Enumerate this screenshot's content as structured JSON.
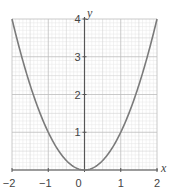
{
  "chart_data": {
    "type": "line",
    "title": "",
    "function": "y = x^2",
    "xlabel": "x",
    "ylabel": "y",
    "xlim": [
      -2,
      2
    ],
    "ylim": [
      0,
      4
    ],
    "x_ticks": [
      -2,
      -1,
      0,
      1,
      2
    ],
    "x_tick_labels": [
      "−2",
      "−1",
      "0",
      "1",
      "2"
    ],
    "y_ticks": [
      1,
      2,
      3,
      4
    ],
    "y_tick_labels": [
      "1",
      "2",
      "3",
      "4"
    ],
    "grid": {
      "major": 1,
      "medium": 0.5,
      "minor": 0.1
    },
    "series": [
      {
        "name": "y = x²",
        "x": [
          -2,
          -1.75,
          -1.5,
          -1.25,
          -1,
          -0.75,
          -0.5,
          -0.25,
          0,
          0.25,
          0.5,
          0.75,
          1,
          1.25,
          1.5,
          1.75,
          2
        ],
        "y": [
          4,
          3.0625,
          2.25,
          1.5625,
          1,
          0.5625,
          0.25,
          0.0625,
          0,
          0.0625,
          0.25,
          0.5625,
          1,
          1.5625,
          2.25,
          3.0625,
          4
        ]
      }
    ],
    "colors": {
      "curve": "#7a7a7a",
      "axis": "#555555",
      "grid_minor": "#e6e6e6",
      "grid_medium": "#d4d4d4",
      "grid_major": "#bcbcbc"
    }
  }
}
